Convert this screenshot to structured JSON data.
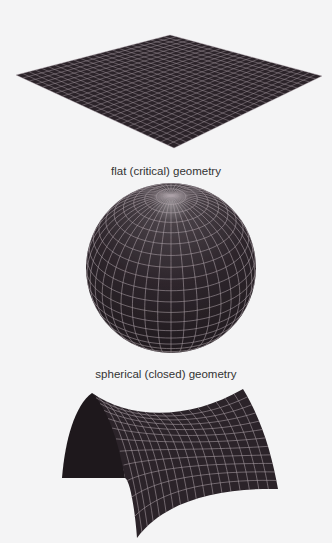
{
  "figures": [
    {
      "id": "flat",
      "caption": "flat (critical) geometry"
    },
    {
      "id": "spherical",
      "caption": "spherical (closed) geometry"
    },
    {
      "id": "hyperbolic",
      "caption": ""
    }
  ],
  "colors": {
    "background": "#f4f4f5",
    "surface": "#2b2329",
    "grid": "#b9adb4",
    "caption": "#333333"
  }
}
